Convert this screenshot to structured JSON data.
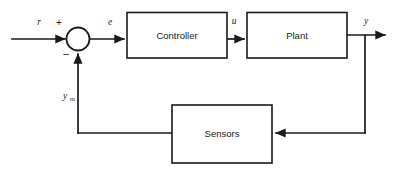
{
  "diagram": {
    "type": "control-block-diagram",
    "background_color": "#ffffff",
    "line_color": "#1a1a1a",
    "blocks": [
      {
        "id": "controller",
        "label": "Controller"
      },
      {
        "id": "plant",
        "label": "Plant"
      },
      {
        "id": "sensors",
        "label": "Sensors"
      }
    ],
    "summing_junction": {
      "id": "summer",
      "plus_sign": "+",
      "minus_sign": "–"
    },
    "signals": [
      {
        "id": "reference",
        "label": "r"
      },
      {
        "id": "error",
        "label": "e"
      },
      {
        "id": "control",
        "label": "u"
      },
      {
        "id": "output",
        "label": "y"
      },
      {
        "id": "measured",
        "label": "y",
        "subscript": "m"
      }
    ]
  }
}
